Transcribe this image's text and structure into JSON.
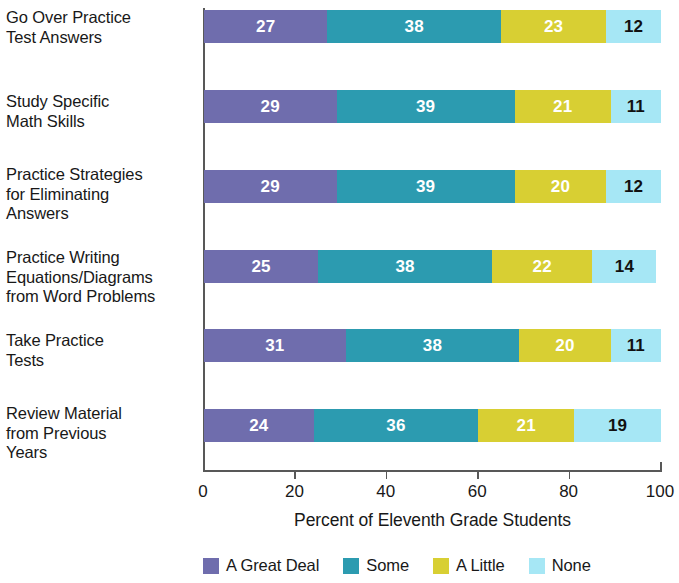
{
  "chart_data": {
    "type": "bar",
    "orientation": "horizontal",
    "stacked": true,
    "stack_mode": "percent",
    "title": "",
    "subtitle": "",
    "xlabel": "Percent of Eleventh Grade Students",
    "ylabel": "",
    "xlim": [
      0,
      100
    ],
    "xticks": [
      0,
      20,
      40,
      60,
      80,
      100
    ],
    "xtick_labels": [
      "0",
      "20",
      "40",
      "60",
      "80",
      "100"
    ],
    "grid": false,
    "legend_position": "bottom",
    "categories": [
      "Go Over Practice Test Answers",
      "Study Specific Math Skills",
      "Practice Strategies for Eliminating Answers",
      "Practice Writing Equations/Diagrams from Word Problems",
      "Take Practice Tests",
      "Review Material from Previous Years"
    ],
    "category_lines": [
      [
        "Go Over Practice",
        "Test Answers"
      ],
      [
        "Study Specific",
        "Math Skills"
      ],
      [
        "Practice Strategies",
        "for Eliminating",
        "Answers"
      ],
      [
        "Practice Writing",
        "Equations/Diagrams",
        "from Word Problems"
      ],
      [
        "Take Practice",
        "Tests"
      ],
      [
        "Review Material",
        "from Previous",
        "Years"
      ]
    ],
    "series": [
      {
        "name": "A Great Deal",
        "color": "#6f6dad",
        "label_color": "#ffffff",
        "values": [
          27,
          29,
          29,
          25,
          31,
          24
        ]
      },
      {
        "name": "Some",
        "color": "#2c9bb0",
        "label_color": "#ffffff",
        "values": [
          38,
          39,
          39,
          38,
          38,
          36
        ]
      },
      {
        "name": "A Little",
        "color": "#d8cf33",
        "label_color": "#ffffff",
        "values": [
          23,
          21,
          20,
          22,
          20,
          21
        ]
      },
      {
        "name": "None",
        "color": "#a6e7f5",
        "label_color": "#111111",
        "values": [
          12,
          11,
          12,
          14,
          11,
          19
        ]
      }
    ]
  },
  "legend": {
    "items": [
      {
        "label": "A Great Deal",
        "color": "#6f6dad"
      },
      {
        "label": "Some",
        "color": "#2c9bb0"
      },
      {
        "label": "A Little",
        "color": "#d8cf33"
      },
      {
        "label": "None",
        "color": "#a6e7f5"
      }
    ]
  },
  "axis": {
    "x_title": "Percent of Eleventh Grade Students",
    "x_tick_labels": [
      "0",
      "20",
      "40",
      "60",
      "80",
      "100"
    ]
  }
}
